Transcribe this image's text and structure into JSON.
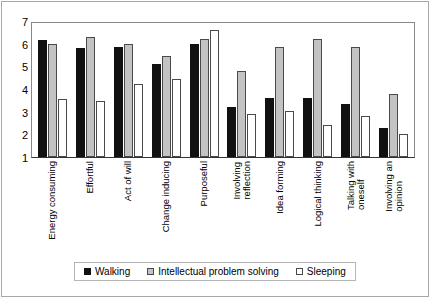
{
  "chart_data": {
    "type": "bar",
    "title": "",
    "subtitle": "",
    "xlabel": "",
    "ylabel": "",
    "ylim": [
      1,
      7
    ],
    "yticks": [
      1,
      2,
      3,
      4,
      5,
      6,
      7
    ],
    "grid": false,
    "legend_position": "bottom",
    "categories": [
      "Energy consuming",
      "Effortful",
      "Act of will",
      "Change inducing",
      "Purposeful",
      "Involving reflection",
      "Idea forming",
      "Logical thinking",
      "Talking with oneself",
      "Involving an opinion"
    ],
    "category_lines": [
      [
        "Energy consuming"
      ],
      [
        "Effortful"
      ],
      [
        "Act of will"
      ],
      [
        "Change inducing"
      ],
      [
        "Purposeful"
      ],
      [
        "Involving",
        "reflection"
      ],
      [
        "Idea forming"
      ],
      [
        "Logical thinking"
      ],
      [
        "Talking with",
        "oneself"
      ],
      [
        "Involving an",
        "opinion"
      ]
    ],
    "series": [
      {
        "name": "Walking",
        "color": "#111111",
        "values": [
          6.15,
          5.8,
          5.85,
          5.1,
          6.0,
          3.2,
          3.6,
          3.6,
          3.35,
          2.3
        ]
      },
      {
        "name": "Intellectual problem solving",
        "color": "#c3c3c3",
        "values": [
          6.0,
          6.3,
          6.0,
          5.45,
          6.2,
          4.8,
          5.85,
          6.2,
          5.85,
          3.8
        ]
      },
      {
        "name": "Sleeping",
        "color": "#ffffff",
        "values": [
          3.55,
          3.45,
          4.2,
          4.45,
          6.6,
          2.9,
          3.05,
          2.4,
          2.8,
          2.0
        ]
      }
    ]
  },
  "legend": {
    "items": [
      {
        "label": "Walking"
      },
      {
        "label": "Intellectual problem solving"
      },
      {
        "label": "Sleeping"
      }
    ]
  }
}
